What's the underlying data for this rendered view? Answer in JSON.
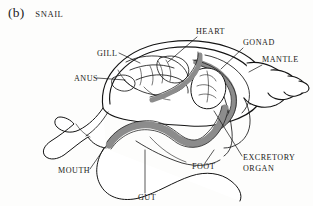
{
  "figure": {
    "index": "(b)",
    "title": "SNAIL",
    "background_color": "#fdfdfc",
    "ink_color": "#1a1a1a",
    "shaded_organ_color": "#8c8c8c"
  },
  "labels": [
    {
      "id": "gill",
      "text": "GILL",
      "text_x": 97,
      "text_y": 56,
      "anchor": "start",
      "leader": "M 119 53 L 140 63"
    },
    {
      "id": "heart",
      "text": "HEART",
      "text_x": 196,
      "text_y": 34,
      "anchor": "start",
      "leader": "M 197 37 L 168 62"
    },
    {
      "id": "gonad",
      "text": "GONAD",
      "text_x": 243,
      "text_y": 45,
      "anchor": "start",
      "leader": "M 243 48 L 222 69"
    },
    {
      "id": "mantle",
      "text": "MANTLE",
      "text_x": 262,
      "text_y": 62,
      "anchor": "start",
      "leader": "M 262 65 L 249 72"
    },
    {
      "id": "anus",
      "text": "ANUS",
      "text_x": 74,
      "text_y": 81,
      "anchor": "start",
      "leader": "M 97 78 L 125 80"
    },
    {
      "id": "excretory-organ",
      "text_lines": [
        "EXCRETORY",
        "ORGAN"
      ],
      "text": "EXCRETORY ORGAN",
      "text_x": 243,
      "text_y": 160,
      "anchor": "start",
      "leader": "M 242 156 L 214 111"
    },
    {
      "id": "foot",
      "text": "FOOT",
      "text_x": 192,
      "text_y": 169,
      "anchor": "start",
      "leader": "M 205 163 L 214 150"
    },
    {
      "id": "mouth",
      "text": "MOUTH",
      "text_x": 58,
      "text_y": 173,
      "anchor": "start",
      "leader": "M 90 169 L 106 146"
    },
    {
      "id": "gut",
      "text": "GUT",
      "text_x": 138,
      "text_y": 200,
      "anchor": "start",
      "leader": "M 145 193 L 145 150"
    }
  ],
  "diagram_geometry": {
    "shell_outer": "M 103 108 C 98 74 128 47 168 42 C 214 36 252 52 262 72 C 268 84 266 96 258 105 C 246 119 218 128 190 126 C 150 123 110 122 103 108 Z",
    "shell_inner_rim": "M 110 104 C 106 76 133 53 169 48 C 209 43 245 57 254 75 C 259 86 257 96 250 104",
    "shell_spiral_whorls": [
      "M 247 63 C 264 60 281 69 287 80 C 292 90 287 100 276 105 C 264 110 250 106 244 98",
      "M 271 70 C 284 69 295 76 298 84 C 300 91 295 97 287 99 C 279 101 271 98 268 93",
      "M 288 76 C 297 76 304 81 305 86 C 306 91 302 95 296 96 C 291 97 286 95 284 92",
      "M 299 81 C 305 82 309 85 309 88 C 309 91 306 93 302 93"
    ],
    "mantle_edge_arc": "M 205 55 C 222 58 238 68 246 82 C 252 93 250 105 242 113",
    "visceral_gray_arc": "M 196 62 C 216 66 231 80 234 96 C 236 110 229 122 216 128",
    "body_mass": "M 103 108 C 96 116 88 124 78 129 C 70 133 62 131 57 126 C 53 122 54 117 59 116 C 64 115 70 118 74 122 C 68 128 60 135 52 140 C 46 144 42 150 46 155 C 50 160 58 158 64 154 C 72 148 80 141 88 136 C 92 142 98 146 106 147 C 118 148 131 143 140 136",
    "foot_sole": "M 103 148 C 96 160 94 175 100 186 C 107 198 122 202 138 198 C 156 193 172 182 190 176 C 205 171 220 172 230 180 C 238 186 242 194 240 200",
    "gut_main": "M 106 146 C 114 134 130 126 146 126 C 160 126 170 133 178 138 C 188 144 198 145 206 140 C 216 134 222 122 224 110",
    "gut_mass": "M 108 145 C 116 131 132 122 150 124 C 162 125 170 132 176 137",
    "gut_upper": "M 152 100 C 166 96 180 90 190 80 C 198 72 202 62 200 54",
    "internal_organs": [
      "M 128 62 C 140 56 156 54 170 58 C 182 61 190 68 192 76",
      "M 132 72 C 146 66 162 65 176 70",
      "M 138 82 C 150 76 166 75 180 80 C 188 83 192 89 190 95",
      "M 126 80 C 134 88 146 94 158 95 C 170 96 180 92 186 86",
      "M 146 88 C 152 95 162 100 172 101",
      "M 160 62 C 164 68 166 76 164 84",
      "M 176 60 C 180 66 182 74 180 82",
      "M 120 70 C 124 78 130 85 138 89"
    ],
    "gonad_lobes": "M 198 70 C 208 66 218 70 222 78 C 226 86 224 96 218 102 C 212 108 202 108 196 102 C 190 96 190 84 194 76 Z"
  }
}
